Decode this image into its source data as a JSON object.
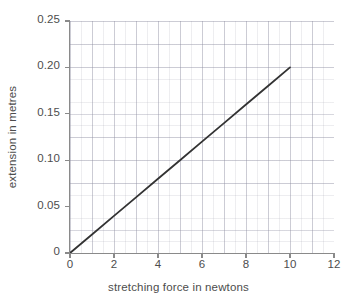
{
  "chart_data": {
    "type": "line",
    "title": "",
    "xlabel": "stretching force in newtons",
    "ylabel": "extension in metres",
    "xlim": [
      0,
      12
    ],
    "ylim": [
      0,
      0.25
    ],
    "xticks": [
      "0",
      "2",
      "4",
      "6",
      "8",
      "10",
      "12"
    ],
    "xtick_values": [
      0,
      2,
      4,
      6,
      8,
      10,
      12
    ],
    "yticks": [
      "0",
      "0.05",
      "0.10",
      "0.15",
      "0.20",
      "0.25"
    ],
    "ytick_values": [
      0,
      0.05,
      0.1,
      0.15,
      0.2,
      0.25
    ],
    "grid": true,
    "grid_major_x_step": 1,
    "grid_major_y_step": 0.025,
    "grid_minor_x_step": 0.5,
    "grid_minor_y_step": 0.0125,
    "legend": null,
    "legend_position": "none",
    "series": [
      {
        "name": "extension vs stretching force",
        "x": [
          0,
          1,
          2,
          3,
          4,
          5,
          6,
          7,
          8,
          9,
          10
        ],
        "values": [
          0,
          0.02,
          0.04,
          0.06,
          0.08,
          0.1,
          0.12,
          0.14,
          0.16,
          0.18,
          0.2
        ],
        "slope": 0.02,
        "intercept": 0,
        "color": "#333333",
        "linewidth": 1.8,
        "markers": "none"
      }
    ],
    "annotations": []
  },
  "style": {
    "background": "#ffffff",
    "axis_color": "#8a8a8a",
    "text_color": "#4d4d4d",
    "grid_color": "#8c8ca0",
    "line_color": "#333333"
  }
}
